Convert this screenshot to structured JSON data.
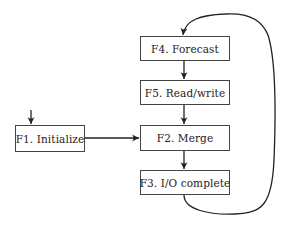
{
  "diagram": {
    "type": "flowchart",
    "nodes": [
      {
        "id": "F1",
        "label": "F1.  Initialize"
      },
      {
        "id": "F2",
        "label": "F2.  Merge"
      },
      {
        "id": "F3",
        "label": "F3.  I/O complete"
      },
      {
        "id": "F4",
        "label": "F4.  Forecast"
      },
      {
        "id": "F5",
        "label": "F5.  Read/write"
      }
    ],
    "edges": [
      {
        "from": "start",
        "to": "F1"
      },
      {
        "from": "F1",
        "to": "F2"
      },
      {
        "from": "F4",
        "to": "F5"
      },
      {
        "from": "F5",
        "to": "F2"
      },
      {
        "from": "F2",
        "to": "F3"
      },
      {
        "from": "F3",
        "to": "F4",
        "style": "curved-loop"
      }
    ]
  },
  "labels": {
    "f1": "F1.  Initialize",
    "f2": "F2.  Merge",
    "f3": "F3.  I/O complete",
    "f4": "F4.  Forecast",
    "f5": "F5.  Read/write"
  }
}
